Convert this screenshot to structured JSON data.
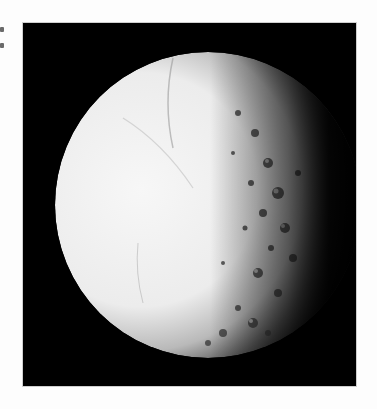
{
  "page": {
    "background": "#fdfdfd"
  },
  "photo": {
    "subject": "icy moon, illuminated from the left",
    "frame": {
      "x": 23,
      "y": 23,
      "width": 333,
      "height": 363,
      "background": "#000000"
    },
    "moon": {
      "center_x": 185,
      "center_y": 182,
      "radius": 153,
      "lit_color": "#f2f2f2",
      "shadow_color": "#000000"
    }
  }
}
